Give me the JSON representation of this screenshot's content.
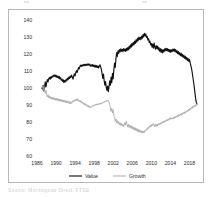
{
  "figure": {
    "background": "#ffffff",
    "frame_color": "#b9b9b9",
    "source_caption": "Source: Morningstar Direct, FTSE"
  },
  "legend": {
    "position": "bottom-center",
    "entries": [
      {
        "label": "Value",
        "color": "#111111",
        "width": 1.15
      },
      {
        "label": "Growth",
        "color": "#a6a6a6",
        "width": 0.9
      }
    ]
  },
  "chart_data": {
    "type": "line",
    "title": "",
    "subtitle": "",
    "xlabel": "",
    "ylabel": "",
    "grid": false,
    "legend_position": "bottom-center",
    "xlim": [
      1986,
      2020
    ],
    "ylim": [
      60,
      140
    ],
    "ytick_labels": [
      "60",
      "70",
      "80",
      "90",
      "100",
      "110",
      "120",
      "130",
      "140"
    ],
    "yticks": [
      60,
      70,
      80,
      90,
      100,
      110,
      120,
      130,
      140
    ],
    "xtick_labels": [
      "1986",
      "1990",
      "1994",
      "1998",
      "2002",
      "2006",
      "2010",
      "2014",
      "2018"
    ],
    "xticks": [
      1986,
      1990,
      1994,
      1998,
      2002,
      2006,
      2010,
      2014,
      2018
    ],
    "x_start": 1987.0,
    "x_end": 2019.6,
    "series": [
      {
        "name": "Value",
        "color": "#111111",
        "values": [
          100.0,
          99.2,
          101.6,
          98.3,
          100.4,
          103.6,
          100.7,
          102.8,
          104.9,
          103.6,
          105.4,
          106.2,
          105.1,
          106.6,
          105.9,
          107.1,
          106.4,
          107.5,
          106.9,
          107.8,
          106.6,
          107.4,
          106.2,
          107.0,
          105.8,
          106.9,
          105.4,
          106.1,
          104.6,
          105.3,
          103.9,
          104.8,
          103.2,
          104.4,
          103.6,
          105.0,
          104.2,
          105.8,
          104.9,
          106.4,
          105.6,
          107.0,
          106.2,
          107.6,
          106.5,
          105.2,
          106.8,
          108.4,
          107.1,
          108.9,
          110.2,
          109.1,
          110.6,
          112.0,
          111.2,
          112.6,
          113.4,
          112.7,
          113.6,
          112.9,
          113.8,
          113.1,
          113.9,
          113.2,
          114.0,
          113.3,
          114.1,
          113.4,
          114.2,
          113.6,
          112.8,
          113.7,
          112.9,
          113.8,
          112.6,
          113.5,
          112.4,
          113.4,
          112.2,
          113.2,
          112.1,
          113.0,
          111.8,
          112.8,
          113.6,
          112.4,
          110.8,
          108.4,
          105.6,
          108.2,
          104.3,
          101.6,
          103.8,
          100.4,
          98.6,
          101.2,
          97.8,
          100.8,
          104.2,
          101.6,
          106.4,
          103.2,
          108.6,
          105.4,
          110.8,
          114.6,
          112.1,
          117.4,
          120.8,
          118.6,
          121.9,
          120.4,
          122.6,
          121.2,
          123.0,
          121.6,
          122.8,
          121.4,
          123.2,
          121.8,
          122.9,
          121.5,
          123.4,
          122.0,
          123.8,
          122.4,
          124.6,
          123.2,
          125.4,
          124.0,
          126.2,
          124.8,
          126.8,
          125.4,
          127.6,
          126.2,
          128.4,
          127.0,
          129.2,
          127.8,
          130.0,
          128.6,
          129.8,
          128.4,
          130.6,
          129.2,
          131.4,
          130.0,
          132.2,
          130.6,
          131.8,
          129.8,
          130.4,
          128.2,
          129.0,
          126.8,
          127.6,
          125.4,
          126.2,
          124.0,
          125.8,
          123.4,
          126.4,
          124.2,
          122.8,
          125.0,
          123.2,
          124.6,
          122.4,
          123.8,
          121.6,
          123.2,
          121.0,
          122.8,
          120.6,
          122.4,
          121.2,
          123.0,
          121.8,
          123.4,
          122.0,
          123.2,
          121.6,
          122.8,
          121.2,
          122.6,
          121.0,
          122.4,
          121.4,
          122.9,
          121.8,
          123.0,
          121.4,
          122.6,
          120.8,
          122.0,
          120.2,
          121.4,
          119.6,
          120.8,
          119.0,
          120.4,
          118.6,
          119.8,
          118.0,
          119.2,
          117.4,
          118.6,
          116.8,
          118.0,
          116.2,
          117.4,
          115.6,
          116.8,
          114.8,
          113.2,
          111.4,
          109.0,
          106.2,
          103.4,
          100.2,
          96.8,
          93.4,
          91.2,
          90.6
        ]
      },
      {
        "name": "Growth",
        "color": "#a6a6a6",
        "values": [
          100.0,
          100.8,
          98.4,
          101.2,
          99.0,
          96.8,
          98.6,
          96.2,
          94.8,
          96.0,
          94.2,
          95.4,
          93.8,
          94.9,
          93.4,
          94.6,
          93.2,
          94.4,
          93.0,
          94.2,
          92.8,
          94.0,
          92.6,
          93.8,
          92.4,
          93.6,
          92.2,
          93.4,
          92.0,
          93.2,
          91.8,
          93.0,
          91.6,
          92.8,
          91.4,
          92.6,
          91.2,
          92.4,
          91.0,
          92.2,
          90.8,
          92.0,
          90.6,
          91.8,
          91.4,
          92.6,
          91.8,
          93.0,
          92.2,
          93.4,
          92.6,
          93.8,
          92.4,
          93.2,
          92.0,
          92.8,
          91.6,
          92.4,
          91.0,
          91.8,
          90.4,
          91.2,
          90.0,
          90.8,
          89.4,
          90.2,
          89.0,
          89.8,
          88.6,
          89.4,
          88.2,
          89.0,
          88.8,
          89.6,
          89.2,
          90.0,
          89.6,
          90.4,
          89.8,
          90.6,
          90.0,
          90.8,
          90.2,
          91.0,
          90.4,
          91.2,
          90.6,
          91.4,
          91.0,
          91.8,
          91.4,
          92.2,
          91.8,
          92.6,
          92.2,
          93.0,
          92.4,
          91.6,
          90.2,
          88.4,
          86.2,
          88.0,
          85.4,
          87.2,
          84.0,
          82.2,
          80.4,
          81.8,
          79.6,
          80.8,
          79.0,
          80.2,
          78.4,
          79.6,
          78.0,
          79.2,
          77.6,
          78.8,
          77.2,
          78.4,
          79.8,
          78.2,
          80.4,
          78.6,
          77.0,
          78.6,
          76.8,
          78.2,
          76.4,
          77.8,
          76.0,
          77.4,
          75.6,
          77.0,
          75.2,
          76.6,
          74.8,
          76.2,
          74.4,
          75.8,
          74.0,
          75.4,
          73.8,
          75.0,
          73.6,
          74.8,
          73.4,
          74.6,
          73.8,
          75.2,
          74.6,
          76.0,
          75.4,
          76.8,
          76.2,
          77.6,
          76.8,
          78.2,
          77.4,
          78.8,
          77.8,
          79.2,
          78.4,
          77.2,
          78.6,
          77.4,
          78.8,
          77.6,
          79.0,
          78.2,
          79.4,
          78.6,
          79.8,
          79.0,
          80.2,
          79.4,
          80.6,
          79.8,
          81.0,
          80.2,
          81.4,
          80.6,
          81.8,
          81.0,
          82.2,
          81.4,
          82.6,
          81.8,
          82.4,
          81.6,
          82.8,
          82.0,
          83.2,
          82.4,
          83.6,
          82.8,
          84.0,
          83.2,
          84.4,
          83.6,
          84.8,
          84.0,
          85.2,
          84.4,
          85.6,
          84.8,
          86.0,
          85.2,
          86.4,
          85.8,
          87.0,
          86.2,
          87.6,
          86.8,
          88.2,
          87.4,
          88.8,
          88.0,
          89.4,
          88.6,
          89.8,
          89.0,
          90.2,
          89.6,
          90.8
        ]
      }
    ]
  }
}
